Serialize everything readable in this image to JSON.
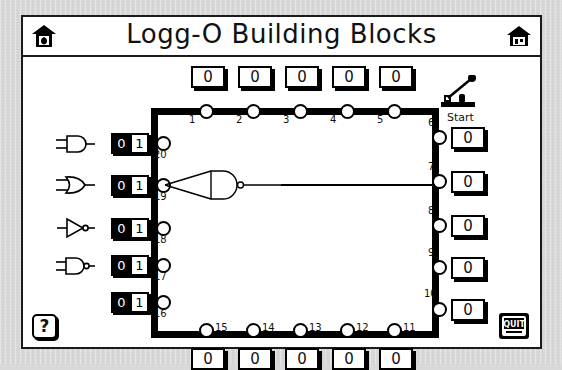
{
  "window": {
    "title": "Logg-O Building Blocks",
    "home_icon_left": "home-icon",
    "home_icon_right": "home-icon"
  },
  "start": {
    "label": "Start",
    "icon": "knife-switch-lever-icon",
    "state": "open"
  },
  "palette": {
    "gates": [
      {
        "name": "and-gate",
        "label": "AND"
      },
      {
        "name": "or-gate",
        "label": "OR"
      },
      {
        "name": "not-gate",
        "label": "NOT"
      },
      {
        "name": "nand-gate",
        "label": "NAND"
      }
    ]
  },
  "switches": [
    {
      "pin": "20",
      "off": "0",
      "on": "1",
      "active": "1"
    },
    {
      "pin": "19",
      "off": "0",
      "on": "1",
      "active": "1"
    },
    {
      "pin": "18",
      "off": "0",
      "on": "1",
      "active": "1"
    },
    {
      "pin": "17",
      "off": "0",
      "on": "1",
      "active": "1"
    },
    {
      "pin": "16",
      "off": "0",
      "on": "1",
      "active": "1"
    }
  ],
  "top_pins": [
    {
      "pin": "1",
      "value": "0"
    },
    {
      "pin": "2",
      "value": "0"
    },
    {
      "pin": "3",
      "value": "0"
    },
    {
      "pin": "4",
      "value": "0"
    },
    {
      "pin": "5",
      "value": "0"
    }
  ],
  "right_pins": [
    {
      "pin": "6",
      "value": "0"
    },
    {
      "pin": "7",
      "value": "0"
    },
    {
      "pin": "8",
      "value": "0"
    },
    {
      "pin": "9",
      "value": "0"
    },
    {
      "pin": "10",
      "value": "0"
    }
  ],
  "bottom_pins": [
    {
      "pin": "15",
      "value": "0"
    },
    {
      "pin": "14",
      "value": "0"
    },
    {
      "pin": "13",
      "value": "0"
    },
    {
      "pin": "12",
      "value": "0"
    },
    {
      "pin": "11",
      "value": "0"
    }
  ],
  "placed_gate": {
    "type": "nand-gate",
    "input_pin": "19",
    "output_pin": "7"
  },
  "buttons": {
    "help": "?",
    "quit": "QUIT"
  },
  "colors": {
    "ink": "#000000",
    "paper": "#ffffff",
    "desktop": "#d9d9d9"
  }
}
